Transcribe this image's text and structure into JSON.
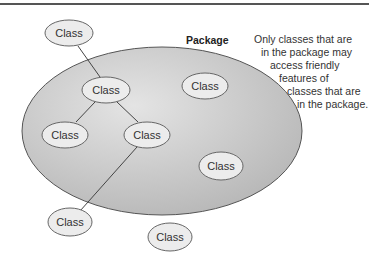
{
  "diagram": {
    "package": {
      "label": "Package",
      "fill_color": "#c8c8c8",
      "stroke_color": "#555555"
    },
    "note_lines": [
      "Only classes that are",
      "in the package may",
      "access friendly",
      "features of",
      "classes that are",
      "in the package."
    ],
    "classes": [
      {
        "id": "c1",
        "label": "Class",
        "location": "outside"
      },
      {
        "id": "c2",
        "label": "Class",
        "location": "inside"
      },
      {
        "id": "c3",
        "label": "Class",
        "location": "inside"
      },
      {
        "id": "c4",
        "label": "Class",
        "location": "inside"
      },
      {
        "id": "c5",
        "label": "Class",
        "location": "inside"
      },
      {
        "id": "c6",
        "label": "Class",
        "location": "inside"
      },
      {
        "id": "c7",
        "label": "Class",
        "location": "outside"
      },
      {
        "id": "c8",
        "label": "Class",
        "location": "outside"
      }
    ],
    "edges": [
      {
        "from": "c1",
        "to": "c2"
      },
      {
        "from": "c2",
        "to": "c3"
      },
      {
        "from": "c2",
        "to": "c4"
      },
      {
        "from": "c4",
        "to": "c7"
      }
    ],
    "class_fill": "#ececec",
    "class_stroke": "#666666"
  }
}
